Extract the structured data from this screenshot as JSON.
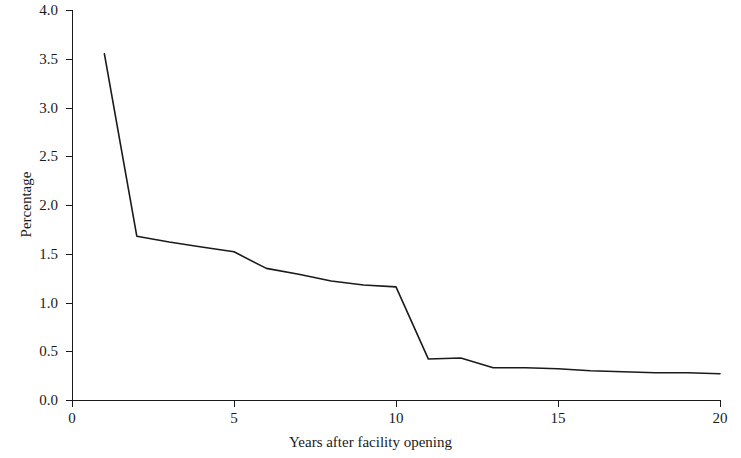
{
  "chart_data": {
    "type": "line",
    "title": "",
    "xlabel": "Years after facility opening",
    "ylabel": "Percentage",
    "xlim": [
      0,
      20
    ],
    "ylim": [
      0.0,
      4.0
    ],
    "grid": false,
    "legend": "none",
    "xticks": [
      0,
      5,
      10,
      15,
      20
    ],
    "xtick_labels": [
      "0",
      "5",
      "10",
      "15",
      "20"
    ],
    "yticks": [
      0.0,
      0.5,
      1.0,
      1.5,
      2.0,
      2.5,
      3.0,
      3.5,
      4.0
    ],
    "ytick_labels": [
      "0.0",
      "0.5",
      "1.0",
      "1.5",
      "2.0",
      "2.5",
      "3.0",
      "3.5",
      "4.0"
    ],
    "line_color": "#1a1a1a",
    "x": [
      1,
      2,
      3,
      4,
      5,
      6,
      7,
      8,
      9,
      10,
      11,
      12,
      13,
      14,
      15,
      16,
      17,
      18,
      19,
      20
    ],
    "values": [
      3.55,
      1.68,
      1.62,
      1.57,
      1.52,
      1.35,
      1.29,
      1.22,
      1.18,
      1.16,
      0.42,
      0.43,
      0.33,
      0.33,
      0.32,
      0.3,
      0.29,
      0.28,
      0.28,
      0.27
    ],
    "series": [
      {
        "name": "Percentage",
        "values": [
          3.55,
          1.68,
          1.62,
          1.57,
          1.52,
          1.35,
          1.29,
          1.22,
          1.18,
          1.16,
          0.42,
          0.43,
          0.33,
          0.33,
          0.32,
          0.3,
          0.29,
          0.28,
          0.28,
          0.27
        ]
      }
    ]
  }
}
